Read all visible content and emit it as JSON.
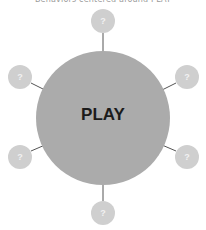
{
  "caption": "Behaviors centered around PLAY",
  "center": {
    "label": "PLAY",
    "color": "#ababab"
  },
  "nodes": [
    {
      "id": "top",
      "label": "?"
    },
    {
      "id": "top-right",
      "label": "?"
    },
    {
      "id": "bottom-right",
      "label": "?"
    },
    {
      "id": "bottom",
      "label": "?"
    },
    {
      "id": "bottom-left",
      "label": "?"
    },
    {
      "id": "top-left",
      "label": "?"
    }
  ],
  "colors": {
    "node": "#cfcfcf",
    "connector": "#555555",
    "center": "#ababab"
  }
}
